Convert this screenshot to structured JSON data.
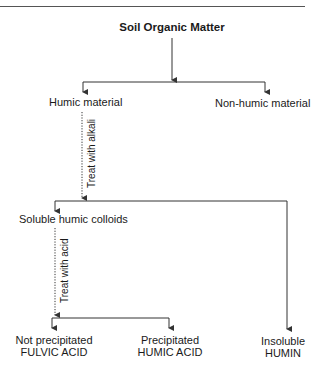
{
  "diagram": {
    "root": "Soil Organic Matter",
    "level1": {
      "left": "Humic material",
      "right": "Non-humic material"
    },
    "step1_label": "Treat with alkali",
    "level2": {
      "left": "Soluble humic colloids"
    },
    "step2_label": "Treat with acid",
    "leaves": [
      {
        "line1": "Not precipitated",
        "line2": "FULVIC ACID"
      },
      {
        "line1": "Precipitated",
        "line2": "HUMIC ACID"
      },
      {
        "line1": "Insoluble",
        "line2": "HUMIN"
      }
    ]
  },
  "colors": {
    "line": "#333333",
    "text": "#1a1a1a",
    "background": "#ffffff"
  }
}
